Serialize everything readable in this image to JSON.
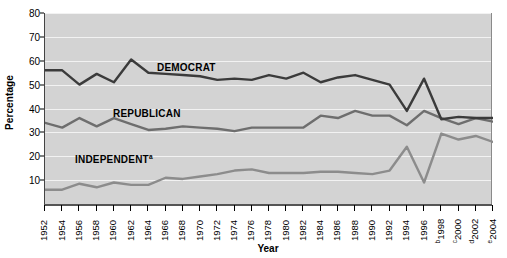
{
  "chart_data": {
    "type": "line",
    "title": "",
    "xlabel": "Year",
    "ylabel": "Percentage",
    "ylim": [
      0,
      80
    ],
    "ytick_step": 10,
    "yticks": [
      0,
      10,
      20,
      30,
      40,
      50,
      60,
      70,
      80
    ],
    "ytick_labels": [
      "",
      "10",
      "20",
      "30",
      "40",
      "50",
      "60",
      "70",
      "80"
    ],
    "grid": true,
    "grid_color": "#f2f2f2",
    "plot_background": "#d3d3d3",
    "legend_position": "inline-on-lines",
    "categories": [
      "1952",
      "1954",
      "1956",
      "1958",
      "1960",
      "1962",
      "1964",
      "1966",
      "1968",
      "1970",
      "1972",
      "1974",
      "1976",
      "1978",
      "1980",
      "1982",
      "1984",
      "1986",
      "1988",
      "1990",
      "1992",
      "1994",
      "1996",
      "1998",
      "2000",
      "2002",
      "2004"
    ],
    "category_superscripts": {
      "1998": "b",
      "2000": "c",
      "2002": "d",
      "2004": "e"
    },
    "series": [
      {
        "name": "DEMOCRAT",
        "color": "#3b3b3b",
        "values": [
          56,
          56,
          50,
          54.5,
          51,
          60.5,
          55,
          54.5,
          54,
          53.5,
          52,
          52.5,
          52,
          54,
          52.5,
          55,
          51,
          53,
          54,
          52,
          50,
          39,
          52.5,
          35.5,
          36.5,
          36,
          36
        ]
      },
      {
        "name": "REPUBLICAN",
        "color": "#6e6e6e",
        "values": [
          34,
          32,
          36,
          32.5,
          36,
          33.5,
          31,
          31.5,
          32.5,
          32,
          31.5,
          30.5,
          32,
          32,
          32,
          32,
          37,
          36,
          39,
          37,
          37,
          33,
          39,
          36,
          33.5,
          36,
          34.5
        ]
      },
      {
        "name": "INDEPENDENT",
        "superscript": "a",
        "color": "#8c8c8c",
        "values": [
          6,
          6,
          8.5,
          7,
          9,
          8,
          8,
          11,
          10.5,
          11.5,
          12.5,
          14,
          14.5,
          13,
          13,
          13,
          13.5,
          13.5,
          13,
          12.5,
          14,
          24,
          9,
          29.5,
          27,
          28.5,
          26
        ]
      }
    ],
    "annotations": []
  }
}
